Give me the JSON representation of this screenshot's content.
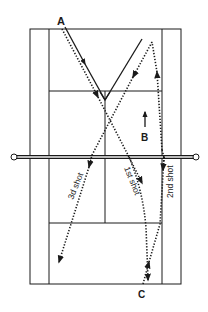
{
  "diagram": {
    "type": "tennis court shot diagram",
    "colors": {
      "line": "#1a1a1a",
      "background": "#ffffff"
    },
    "players": [
      {
        "id": "A",
        "label": "A"
      },
      {
        "id": "B",
        "label": "B"
      },
      {
        "id": "C",
        "label": "C"
      }
    ],
    "shots": [
      {
        "id": "shot1",
        "label": "1st shot",
        "style": "dotted"
      },
      {
        "id": "shot2",
        "label": "2nd shot",
        "style": "dotted"
      },
      {
        "id": "shot3",
        "label": "3d shot",
        "style": "dotted"
      }
    ],
    "movement": {
      "id": "player-a-path",
      "style": "solid"
    }
  }
}
